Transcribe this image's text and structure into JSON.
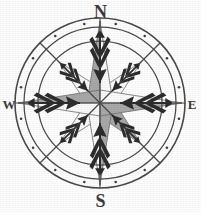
{
  "image": {
    "title": "Compass rose",
    "subject": "compass-rose",
    "background_color": "#ffffff",
    "style": "scanned grayscale line art"
  },
  "compass": {
    "center": {
      "x": 100,
      "y": 103
    },
    "rings": [
      {
        "name": "outer-ring",
        "radius": 85,
        "stroke": "#4a4a4a",
        "stroke_width": 1.6
      },
      {
        "name": "mid-ring",
        "radius": 76,
        "stroke": "#4a4a4a",
        "stroke_width": 1.3
      },
      {
        "name": "inner-ring",
        "radius": 62,
        "stroke": "#4a4a4a",
        "stroke_width": 1.3
      }
    ],
    "ring_dot": {
      "name": "ring-dot",
      "radius": 1.3,
      "orbit_radius": 80.5,
      "color": "#3f3f3f",
      "count": 16,
      "angle_offset_deg": 11.25
    },
    "colors": {
      "star_gray": "#a9a9a9",
      "star_white": "#fbfbfb",
      "star_outline": "#6d6d6d",
      "line": "#4a4a4a",
      "arrow_dark": "#2d2d2d",
      "text": "#3a3a3a"
    },
    "star": {
      "major_points": 4,
      "minor_points": 4,
      "major_radius": 82,
      "minor_radius": 58,
      "waist_radius": 13,
      "total_points": 8
    },
    "points": [
      {
        "name": "north",
        "abbrev": "N",
        "angle_deg": 0,
        "kind": "major",
        "fill": "gray"
      },
      {
        "name": "northeast",
        "abbrev": "NE",
        "angle_deg": 45,
        "kind": "minor",
        "fill": "white"
      },
      {
        "name": "east",
        "abbrev": "E",
        "angle_deg": 90,
        "kind": "major",
        "fill": "gray"
      },
      {
        "name": "southeast",
        "abbrev": "SE",
        "angle_deg": 135,
        "kind": "minor",
        "fill": "white"
      },
      {
        "name": "south",
        "abbrev": "S",
        "angle_deg": 180,
        "kind": "major",
        "fill": "gray"
      },
      {
        "name": "southwest",
        "abbrev": "SW",
        "angle_deg": 225,
        "kind": "minor",
        "fill": "white"
      },
      {
        "name": "west",
        "abbrev": "W",
        "angle_deg": 270,
        "kind": "major",
        "fill": "gray"
      },
      {
        "name": "northwest",
        "abbrev": "NW",
        "angle_deg": 315,
        "kind": "minor",
        "fill": "white"
      }
    ],
    "arrows": {
      "description": "fletched dart glyphs pointing inward toward center on all eight headings",
      "count": 8,
      "color": "#2d2d2d"
    },
    "spokes": {
      "description": "thin straight rules crossing the rings on the diagonal and cardinal headings",
      "count": 8,
      "color": "#4a4a4a"
    },
    "labels": {
      "north": "N",
      "south": "S",
      "east": "E",
      "west": "W"
    }
  }
}
